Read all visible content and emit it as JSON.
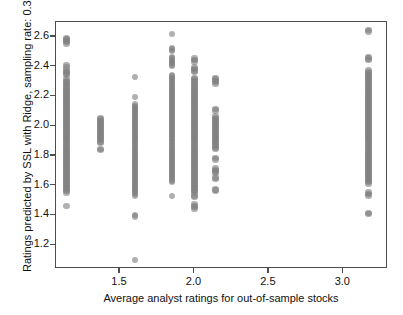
{
  "chart_data": {
    "type": "scatter",
    "title": "",
    "xlabel": "Average analyst ratings for out-of-sample stocks",
    "ylabel": "Ratings predicted by SSL with Ridge, sampling rate: 0.3",
    "xlim": [
      1.07,
      3.3
    ],
    "ylim": [
      1.04,
      2.7
    ],
    "xticks": [
      1.5,
      2.0,
      2.5,
      3.0
    ],
    "xtick_labels": [
      "1.5",
      "2.0",
      "2.5",
      "3.0"
    ],
    "yticks": [
      1.2,
      1.4,
      1.6,
      1.8,
      2.0,
      2.2,
      2.4,
      2.6
    ],
    "ytick_labels": [
      "1.2",
      "1.4",
      "1.6",
      "1.8",
      "2.0",
      "2.2",
      "2.4",
      "2.6"
    ],
    "grid": false,
    "legend": null,
    "marker_color": "#808080",
    "marker_size": 6.4,
    "marker_opacity": 0.62,
    "frame_color": "#4d4d4d",
    "background": "#ffffff",
    "columns": [
      {
        "x": 1.14,
        "label": "cluster-1.14",
        "y": [
          2.59,
          2.585,
          2.575,
          2.565,
          2.555,
          2.41,
          2.395,
          2.375,
          2.365,
          2.355,
          2.345,
          2.315,
          2.305,
          2.295,
          2.285,
          2.275,
          2.265,
          2.255,
          2.245,
          2.235,
          2.225,
          2.215,
          2.205,
          2.195,
          2.185,
          2.175,
          2.165,
          2.155,
          2.145,
          2.135,
          2.125,
          2.115,
          2.105,
          2.095,
          2.085,
          2.075,
          2.065,
          2.055,
          2.045,
          2.035,
          2.025,
          2.015,
          2.005,
          1.995,
          1.985,
          1.975,
          1.965,
          1.955,
          1.945,
          1.935,
          1.925,
          1.915,
          1.905,
          1.895,
          1.885,
          1.875,
          1.865,
          1.855,
          1.845,
          1.835,
          1.825,
          1.815,
          1.805,
          1.795,
          1.785,
          1.775,
          1.765,
          1.755,
          1.745,
          1.735,
          1.725,
          1.715,
          1.705,
          1.695,
          1.685,
          1.675,
          1.665,
          1.655,
          1.645,
          1.635,
          1.625,
          1.615,
          1.605,
          1.595,
          1.585,
          1.575,
          1.565,
          1.555,
          1.465
        ]
      },
      {
        "x": 1.37,
        "label": "cluster-1.37",
        "y": [
          2.055,
          2.045,
          2.035,
          2.025,
          2.015,
          2.005,
          1.995,
          1.985,
          1.975,
          1.965,
          1.955,
          1.945,
          1.935,
          1.925,
          1.915,
          1.905,
          1.895,
          1.885,
          1.845,
          1.838
        ]
      },
      {
        "x": 1.6,
        "label": "cluster-1.60",
        "y": [
          2.33,
          2.195,
          2.145,
          2.135,
          2.125,
          2.115,
          2.105,
          2.095,
          2.085,
          2.075,
          2.065,
          2.055,
          2.045,
          2.035,
          2.025,
          2.015,
          2.005,
          1.995,
          1.985,
          1.975,
          1.965,
          1.955,
          1.945,
          1.935,
          1.925,
          1.915,
          1.905,
          1.895,
          1.885,
          1.875,
          1.865,
          1.855,
          1.845,
          1.835,
          1.825,
          1.815,
          1.805,
          1.795,
          1.785,
          1.775,
          1.765,
          1.755,
          1.745,
          1.735,
          1.725,
          1.715,
          1.705,
          1.695,
          1.685,
          1.675,
          1.665,
          1.655,
          1.645,
          1.635,
          1.625,
          1.615,
          1.605,
          1.595,
          1.585,
          1.575,
          1.565,
          1.555,
          1.545,
          1.53,
          1.405,
          1.392,
          1.1
        ]
      },
      {
        "x": 1.85,
        "label": "cluster-1.85",
        "y": [
          2.62,
          2.525,
          2.515,
          2.505,
          2.465,
          2.455,
          2.445,
          2.435,
          2.425,
          2.415,
          2.405,
          2.345,
          2.335,
          2.325,
          2.315,
          2.305,
          2.295,
          2.285,
          2.275,
          2.265,
          2.255,
          2.245,
          2.235,
          2.225,
          2.215,
          2.205,
          2.195,
          2.185,
          2.175,
          2.165,
          2.155,
          2.145,
          2.135,
          2.125,
          2.115,
          2.105,
          2.095,
          2.085,
          2.075,
          2.065,
          2.055,
          2.045,
          2.035,
          2.025,
          2.015,
          2.005,
          1.995,
          1.985,
          1.975,
          1.965,
          1.955,
          1.945,
          1.935,
          1.925,
          1.915,
          1.905,
          1.895,
          1.885,
          1.875,
          1.865,
          1.855,
          1.845,
          1.835,
          1.825,
          1.815,
          1.805,
          1.795,
          1.785,
          1.775,
          1.765,
          1.755,
          1.745,
          1.735,
          1.725,
          1.715,
          1.705,
          1.695,
          1.685,
          1.675,
          1.665,
          1.655,
          1.645,
          1.635,
          1.625,
          1.53
        ]
      },
      {
        "x": 2.0,
        "label": "cluster-2.00",
        "y": [
          2.455,
          2.445,
          2.435,
          2.395,
          2.385,
          2.375,
          2.365,
          2.325,
          2.315,
          2.305,
          2.295,
          2.285,
          2.275,
          2.265,
          2.255,
          2.245,
          2.235,
          2.225,
          2.215,
          2.205,
          2.195,
          2.185,
          2.175,
          2.165,
          2.155,
          2.145,
          2.135,
          2.125,
          2.115,
          2.105,
          2.095,
          2.085,
          2.075,
          2.065,
          2.055,
          2.045,
          2.035,
          2.025,
          2.015,
          2.005,
          1.995,
          1.985,
          1.975,
          1.965,
          1.955,
          1.945,
          1.935,
          1.925,
          1.915,
          1.905,
          1.895,
          1.885,
          1.875,
          1.865,
          1.855,
          1.845,
          1.835,
          1.825,
          1.815,
          1.805,
          1.795,
          1.785,
          1.775,
          1.765,
          1.755,
          1.745,
          1.735,
          1.725,
          1.715,
          1.705,
          1.695,
          1.685,
          1.675,
          1.665,
          1.655,
          1.645,
          1.635,
          1.625,
          1.615,
          1.605,
          1.595,
          1.585,
          1.575,
          1.565,
          1.555,
          1.535,
          1.525,
          1.475,
          1.465,
          1.455,
          1.445
        ]
      },
      {
        "x": 2.14,
        "label": "cluster-2.14",
        "y": [
          2.325,
          2.315,
          2.305,
          2.295,
          2.285,
          2.115,
          2.105,
          2.065,
          2.055,
          2.045,
          2.035,
          2.025,
          2.015,
          2.005,
          1.995,
          1.985,
          1.975,
          1.965,
          1.955,
          1.945,
          1.935,
          1.925,
          1.915,
          1.905,
          1.895,
          1.885,
          1.875,
          1.865,
          1.855,
          1.845,
          1.785,
          1.775,
          1.715,
          1.705,
          1.695,
          1.685,
          1.655,
          1.645,
          1.575,
          1.568
        ]
      },
      {
        "x": 3.17,
        "label": "cluster-3.17",
        "y": [
          2.645,
          2.635,
          2.465,
          2.455,
          2.445,
          2.375,
          2.365,
          2.355,
          2.345,
          2.335,
          2.325,
          2.315,
          2.305,
          2.295,
          2.285,
          2.275,
          2.265,
          2.255,
          2.245,
          2.235,
          2.225,
          2.215,
          2.205,
          2.195,
          2.185,
          2.175,
          2.165,
          2.155,
          2.145,
          2.135,
          2.125,
          2.115,
          2.105,
          2.095,
          2.085,
          2.075,
          2.065,
          2.055,
          2.045,
          2.035,
          2.025,
          2.015,
          2.005,
          1.995,
          1.985,
          1.975,
          1.965,
          1.955,
          1.945,
          1.935,
          1.925,
          1.915,
          1.905,
          1.895,
          1.885,
          1.875,
          1.865,
          1.855,
          1.845,
          1.835,
          1.825,
          1.815,
          1.805,
          1.795,
          1.785,
          1.775,
          1.765,
          1.755,
          1.745,
          1.735,
          1.725,
          1.715,
          1.705,
          1.695,
          1.685,
          1.675,
          1.665,
          1.655,
          1.645,
          1.635,
          1.625,
          1.615,
          1.555,
          1.545,
          1.535,
          1.415,
          1.408
        ]
      }
    ]
  }
}
